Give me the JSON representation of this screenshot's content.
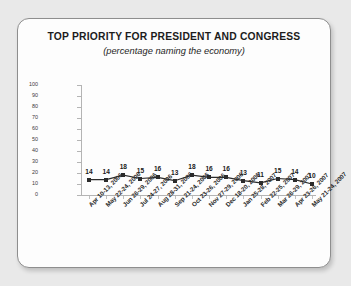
{
  "chart_data": {
    "type": "line",
    "title": "TOP PRIORITY FOR PRESIDENT AND CONGRESS",
    "subtitle": "(percentage naming the economy)",
    "xlabel": "",
    "ylabel": "",
    "ylim": [
      0,
      100
    ],
    "yticks": [
      0,
      10,
      20,
      30,
      40,
      50,
      60,
      70,
      80,
      90,
      100
    ],
    "grid": false,
    "legend": false,
    "marker": "square",
    "series_color": "#2b2b2b",
    "categories": [
      "Apr 10-13, 2006",
      "May 22-24, 2006",
      "Jun 26-29, 2006",
      "Jul 24-27, 2006",
      "Aug 28-31, 2006",
      "Sep 21-24, 2006",
      "Oct 23-26, 2006",
      "Nov 27-29, 2006",
      "Dec 18-20, 2006",
      "Jan 25-28, 2007",
      "Feb 22-25, 2007",
      "Mar 26-29, 2007",
      "Apr 23-26, 2007",
      "May 21-24, 2007"
    ],
    "values": [
      14,
      14,
      18,
      15,
      16,
      13,
      18,
      16,
      16,
      13,
      11,
      15,
      14,
      10
    ],
    "data_labels": [
      "14",
      "14",
      "18",
      "15",
      "16",
      "13",
      "18",
      "16",
      "16",
      "13",
      "11",
      "15",
      "14",
      "10"
    ]
  }
}
